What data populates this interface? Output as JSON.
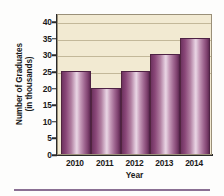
{
  "chart_data": {
    "type": "bar",
    "title": "",
    "subtitle": "",
    "xlabel": "Year",
    "ylabel": "Number of Graduates (in thousands)",
    "ylabel_line1": "Number of Graduates",
    "ylabel_line2": "(in thousands)",
    "categories": [
      "2010",
      "2011",
      "2012",
      "2013",
      "2014"
    ],
    "values": [
      25,
      20,
      25,
      30,
      35
    ],
    "ylim": [
      0,
      42.5
    ],
    "yticks": [
      0,
      5,
      10,
      15,
      20,
      25,
      30,
      35,
      40
    ],
    "ytick_labels": [
      "0",
      "5",
      "10",
      "15",
      "20",
      "25",
      "30",
      "35",
      "40"
    ],
    "gridlines": [
      25,
      30,
      35,
      40
    ],
    "grid": true,
    "legend": "none",
    "series": [
      {
        "name": "Number of Graduates (in thousands)",
        "values": [
          25,
          20,
          25,
          30,
          35
        ]
      }
    ],
    "bars": [
      {
        "category": "2010",
        "value": 25
      },
      {
        "category": "2011",
        "value": 20
      },
      {
        "category": "2012",
        "value": 25
      },
      {
        "category": "2013",
        "value": 30
      },
      {
        "category": "2014",
        "value": 35
      }
    ]
  },
  "colors": {
    "plot_background": "#f2ead2",
    "plot_border": "#9a9079",
    "gridline": "#c3b899",
    "bar_dark": "#6e3360",
    "bar_light": "#e9d6e4",
    "bar_edge": "#4e2244",
    "axis": "#2a2a2a",
    "text": "#1a1a1a",
    "bottom_rule": "#8a6f93",
    "page_background": "#fdfdfc"
  }
}
